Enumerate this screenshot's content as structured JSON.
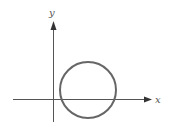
{
  "diagram": {
    "axes": {
      "x_label": "x",
      "y_label": "y",
      "color": "#555555"
    },
    "circle": {
      "color": "#666666",
      "center_px": [
        88,
        90
      ],
      "radius_px": 28
    }
  }
}
